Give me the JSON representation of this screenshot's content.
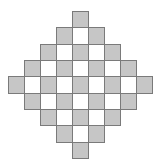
{
  "diagram": {
    "title": "",
    "shape": "diamond checkerboard",
    "grid": {
      "rows": 9,
      "cols": 9,
      "origin": [
        8,
        11
      ],
      "cell_width": 16,
      "cell_height": 16.33
    },
    "colors": {
      "filled": "#c6c6c6",
      "empty": "#ffffff",
      "border": "#7a7a7a",
      "background": "#ffffff"
    },
    "rows": [
      {
        "row": 0,
        "start_col": 4,
        "cells": [
          "grey"
        ]
      },
      {
        "row": 1,
        "start_col": 3,
        "cells": [
          "grey",
          "white",
          "grey"
        ]
      },
      {
        "row": 2,
        "start_col": 2,
        "cells": [
          "grey",
          "white",
          "grey",
          "white",
          "grey"
        ]
      },
      {
        "row": 3,
        "start_col": 1,
        "cells": [
          "grey",
          "white",
          "grey",
          "white",
          "grey",
          "white",
          "grey"
        ]
      },
      {
        "row": 4,
        "start_col": 0,
        "cells": [
          "grey",
          "white",
          "grey",
          "white",
          "grey",
          "white",
          "grey",
          "white",
          "grey"
        ]
      },
      {
        "row": 5,
        "start_col": 1,
        "cells": [
          "grey",
          "white",
          "grey",
          "white",
          "grey",
          "white",
          "grey"
        ]
      },
      {
        "row": 6,
        "start_col": 2,
        "cells": [
          "grey",
          "white",
          "grey",
          "white",
          "grey"
        ]
      },
      {
        "row": 7,
        "start_col": 3,
        "cells": [
          "grey",
          "white",
          "grey"
        ]
      },
      {
        "row": 8,
        "start_col": 4,
        "cells": [
          "grey"
        ]
      }
    ],
    "counts": {
      "total_cells": 41,
      "grey_cells": 25,
      "white_cells": 16
    }
  }
}
